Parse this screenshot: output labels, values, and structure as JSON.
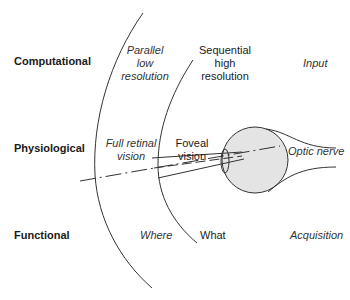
{
  "rows": {
    "computational": "Computational",
    "physiological": "Physiological",
    "functional": "Functional"
  },
  "outer_zone": {
    "computational": "Parallel\nlow\nresolution",
    "physiological": "Full retinal\nvision",
    "functional": "Where"
  },
  "inner_zone": {
    "computational": "Sequential\nhigh\nresolution",
    "physiological": "Foveal\nvision",
    "functional": "What"
  },
  "eye_zone": {
    "computational": "Input",
    "physiological": "Optic nerve",
    "functional": "Acquisition"
  },
  "colors": {
    "line": "#333333",
    "eyeball_fill": "#e4e4e4",
    "text": "#1a1a1a"
  }
}
